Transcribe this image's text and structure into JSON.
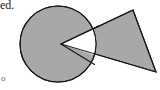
{
  "figure": {
    "background_color": "#ffffff",
    "fill_color": "#a8a8a8",
    "stroke_color": "#141414",
    "wedge_fill_color": "#ffffff",
    "stroke_width": 1.1,
    "circle": {
      "name": "gray-circle",
      "center_x": 58,
      "center_y": 44,
      "radius": 38
    },
    "triangle": {
      "name": "gray-triangle",
      "points": "61,44 133,10 156,72",
      "vertex_apex_x": 61,
      "vertex_apex_y": 44,
      "vertex_top_x": 133,
      "vertex_top_y": 10,
      "vertex_bottom_x": 156,
      "vertex_bottom_y": 72
    },
    "wedge": {
      "name": "white-wedge",
      "points": "61,44 95,27 96,62"
    }
  },
  "text": {
    "fragment_top_left": "ed.",
    "fragment_bottom_left": "o"
  }
}
